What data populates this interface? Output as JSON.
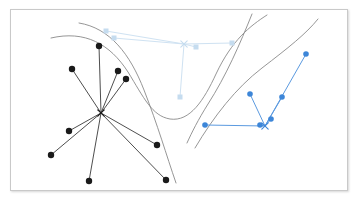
{
  "figure": {
    "title": "",
    "frame": {
      "x": 10,
      "y": 9,
      "width": 338,
      "height": 182,
      "border_color": "#c9c9c9",
      "background": "#ffffff",
      "shadow": true
    },
    "canvas": {
      "width": 358,
      "height": 204
    }
  },
  "chart_data": {
    "type": "scatter",
    "title": "",
    "subtitle": "",
    "xlabel": "",
    "ylabel": "",
    "xlim": [
      10,
      348
    ],
    "ylim": [
      9,
      191
    ],
    "grid": false,
    "legend": null,
    "axis_visible": false,
    "tick_labels": [],
    "annotations": [],
    "series": [
      {
        "name": "cluster-black",
        "color": "#1a1a1a",
        "marker": "circle",
        "marker_size": 5.2,
        "center_marker": "x",
        "center": {
          "x": 101,
          "y": 113
        },
        "spoke_color": "#3a3a3a",
        "spoke_width": 0.9,
        "points": [
          {
            "x": 99,
            "y": 46
          },
          {
            "x": 72,
            "y": 69
          },
          {
            "x": 118,
            "y": 71
          },
          {
            "x": 126,
            "y": 79
          },
          {
            "x": 69,
            "y": 131
          },
          {
            "x": 51,
            "y": 155
          },
          {
            "x": 89,
            "y": 181
          },
          {
            "x": 157,
            "y": 145
          },
          {
            "x": 166,
            "y": 180
          }
        ]
      },
      {
        "name": "cluster-light-blue",
        "color": "#c5dcef",
        "marker": "square",
        "marker_size": 5.0,
        "center_marker": "x",
        "center": {
          "x": 184,
          "y": 44
        },
        "spoke_color": "#cfe2f2",
        "spoke_width": 1.0,
        "points": [
          {
            "x": 106,
            "y": 31
          },
          {
            "x": 114,
            "y": 38
          },
          {
            "x": 196,
            "y": 47
          },
          {
            "x": 232,
            "y": 43
          },
          {
            "x": 180,
            "y": 97
          }
        ]
      },
      {
        "name": "cluster-blue",
        "color": "#3d86d8",
        "marker": "circle",
        "marker_size": 4.4,
        "center_marker": "x",
        "center": {
          "x": 265,
          "y": 126
        },
        "spoke_color": "#5b9ae0",
        "spoke_width": 1.0,
        "points": [
          {
            "x": 205,
            "y": 125
          },
          {
            "x": 260,
            "y": 125
          },
          {
            "x": 250,
            "y": 94
          },
          {
            "x": 271,
            "y": 119
          },
          {
            "x": 282,
            "y": 97
          },
          {
            "x": 306,
            "y": 54
          }
        ]
      }
    ],
    "boundaries": [
      {
        "name": "boundary-upper-left",
        "color": "#8a8a8a",
        "width": 0.9,
        "path": "M 51,38 C 85,30 110,44 128,72 C 144,98 152,116 170,119 C 190,122 204,100 216,74 C 232,40 250,26 267,15"
      },
      {
        "name": "boundary-left-steep",
        "color": "#8a8a8a",
        "width": 0.9,
        "path": "M 79,23 C 110,28 130,54 144,90 C 158,126 166,154 176,183"
      },
      {
        "name": "boundary-right-rising",
        "color": "#8a8a8a",
        "width": 0.9,
        "path": "M 195,148 C 214,116 236,88 262,68 C 288,48 306,34 318,19"
      },
      {
        "name": "boundary-right-outer",
        "color": "#8a8a8a",
        "width": 0.9,
        "path": "M 252,14 C 240,44 226,76 208,104 C 198,120 192,132 187,143"
      }
    ],
    "colors": {
      "black_cluster": "#1a1a1a",
      "light_blue_cluster": "#c5dcef",
      "blue_cluster": "#3d86d8",
      "boundary_curve": "#8a8a8a",
      "panel_border": "#c9c9c9",
      "background": "#ffffff"
    }
  }
}
